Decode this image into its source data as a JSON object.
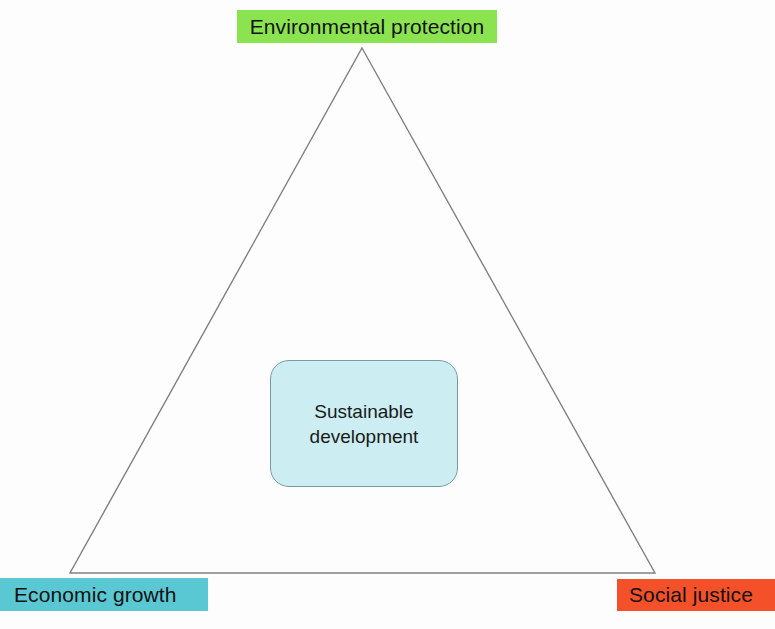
{
  "diagram": {
    "type": "triangle-concept-diagram",
    "background_color": "#fdfdfd",
    "triangle": {
      "name": "sustainability-triangle",
      "stroke_color": "#808080",
      "stroke_width": 1,
      "fill": "none",
      "apex": {
        "x": 362,
        "y": 48
      },
      "bottom_left": {
        "x": 70,
        "y": 573
      },
      "bottom_right": {
        "x": 655,
        "y": 573
      }
    },
    "corners": [
      {
        "id": "environmental",
        "label": "Environmental protection",
        "position": "top",
        "color": "#8ce350"
      },
      {
        "id": "economic",
        "label": "Economic growth",
        "position": "bottom-left",
        "color": "#5ac8d2"
      },
      {
        "id": "social",
        "label": "Social justice",
        "position": "bottom-right",
        "color": "#f4502a"
      }
    ],
    "center": {
      "id": "sustainable-development",
      "line1": "Sustainable",
      "line2": "development",
      "fill_color": "#cceef2",
      "border_color": "#7a9aa6",
      "text_color": "#1a1a1a"
    }
  }
}
